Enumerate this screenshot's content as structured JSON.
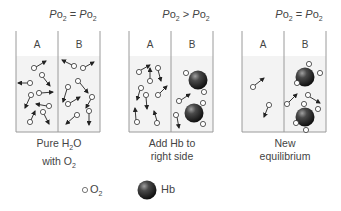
{
  "panels": [
    {
      "id": "panel-1",
      "title": {
        "left": "PO2",
        "op": "=",
        "right": "PO2"
      },
      "compartments": [
        "A",
        "B"
      ],
      "caption_line1": "Pure H2O",
      "caption_line2": "with O2"
    },
    {
      "id": "panel-2",
      "title": {
        "left": "PO2",
        "op": ">",
        "right": "PO2"
      },
      "compartments": [
        "A",
        "B"
      ],
      "caption_line1": "Add Hb to",
      "caption_line2": "right side"
    },
    {
      "id": "panel-3",
      "title": {
        "left": "PO2",
        "op": "=",
        "right": "PO2"
      },
      "compartments": [
        "A",
        "B"
      ],
      "caption_line1": "New",
      "caption_line2": "equilibrium"
    }
  ],
  "legend": {
    "o2_label": "O2",
    "hb_label": "Hb"
  },
  "colors": {
    "border": "#9a9a9a",
    "water": "#f2f2f2",
    "o2_stroke": "#333333",
    "hb_dark": "#1e1e1e",
    "hb_light": "#9a9a9a",
    "text": "#444444"
  }
}
